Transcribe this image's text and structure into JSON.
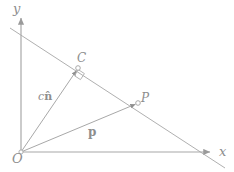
{
  "figure": {
    "kind": "geometry-diagram",
    "title": "",
    "stroke_color": "#a8a8a8",
    "label_color": "#8d8d8d",
    "background": "#ffffff",
    "width": 234,
    "height": 172
  },
  "axes": {
    "x_label": "x",
    "y_label": "y",
    "origin_label": "O",
    "x_axis": {
      "from": [
        21,
        152
      ],
      "to": [
        212,
        152
      ],
      "arrow": "right"
    },
    "y_axis": {
      "from": [
        21,
        152
      ],
      "to": [
        21,
        16
      ],
      "arrow": "up"
    }
  },
  "points": [
    {
      "name": "C",
      "label": "C",
      "at": [
        78,
        68
      ],
      "marker": "open-circle"
    },
    {
      "name": "P",
      "label": "P",
      "at": [
        138,
        103
      ],
      "marker": "open-circle"
    },
    {
      "name": "O",
      "label": "O",
      "at": [
        21,
        152
      ],
      "marker": "open-circle"
    }
  ],
  "lines": [
    {
      "name": "plane-line",
      "from": [
        10,
        28
      ],
      "to": [
        225,
        168
      ]
    },
    {
      "name": "normal-vector-OC",
      "from": [
        21,
        152
      ],
      "to": [
        78,
        68
      ],
      "arrow": "to"
    },
    {
      "name": "position-vector-OP",
      "from": [
        21,
        152
      ],
      "to": [
        138,
        103
      ],
      "arrow": "to"
    }
  ],
  "vector_labels": {
    "normal": {
      "scalar": "c",
      "vector": "n",
      "accent": "hat",
      "text": "cn̂"
    },
    "position": {
      "vector": "p",
      "text": "p"
    }
  },
  "markers": {
    "right_angle": {
      "name": "right-angle-marker",
      "at": [
        80,
        76
      ],
      "size": 8
    }
  }
}
